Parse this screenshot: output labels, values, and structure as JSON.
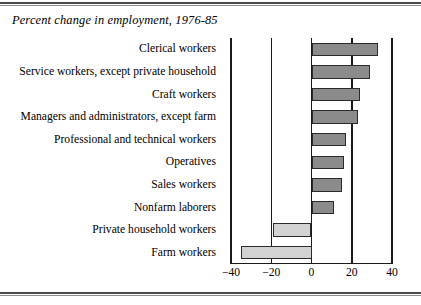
{
  "title": "Percent change in employment, 1976-85",
  "colors": {
    "positive_bar": "#8b8b8b",
    "negative_bar": "#d2d2d2",
    "bar_outline": "#2b2b2b",
    "axis": "#1a1a1a",
    "rule": "#4a4a4a",
    "background": "#ffffff"
  },
  "axis": {
    "ticks": [
      "-40",
      "-20",
      "0",
      "20",
      "40"
    ],
    "tick_values": [
      -40,
      -20,
      0,
      20,
      40
    ],
    "min": -40,
    "max": 40
  },
  "chart_data": {
    "type": "bar",
    "orientation": "horizontal",
    "title": "Percent change in employment, 1976-85",
    "xlabel": "",
    "ylabel": "",
    "xlim": [
      -40,
      40
    ],
    "grid": true,
    "gridlines": [
      -40,
      -20,
      0,
      20,
      40
    ],
    "legend": null,
    "categories": [
      "Clerical workers",
      "Service workers, except private household",
      "Craft workers",
      "Managers and administrators, except farm",
      "Professional and technical workers",
      "Operatives",
      "Sales workers",
      "Nonfarm laborers",
      "Private household workers",
      "Farm workers"
    ],
    "values": [
      33,
      29,
      24,
      23,
      17,
      16,
      15,
      11,
      -19,
      -35
    ],
    "xtick_labels": [
      "-40",
      "-20",
      "0",
      "20",
      "40"
    ],
    "xticks": [
      -40,
      -20,
      0,
      20,
      40
    ]
  }
}
